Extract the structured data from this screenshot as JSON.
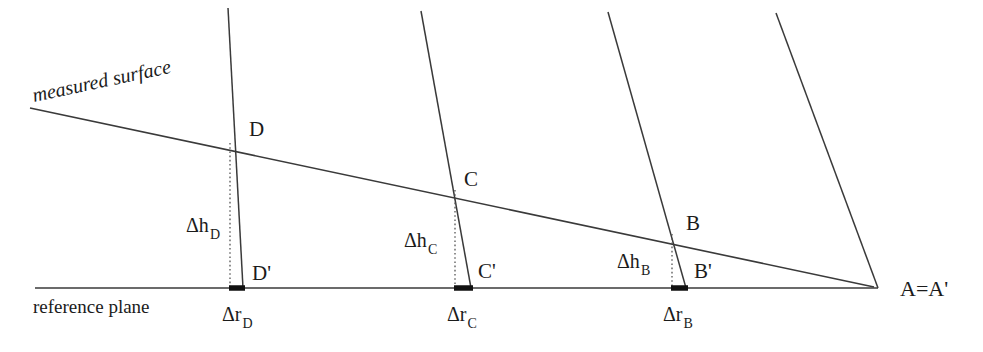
{
  "figure": {
    "width": 983,
    "height": 352,
    "background_color": "#ffffff",
    "line_color": "#3a3a3a",
    "accent_color": "#111111"
  },
  "captions": {
    "measured_surface": "measured surface",
    "reference_plane": "reference plane"
  },
  "apex": {
    "label": "A=A'",
    "x": 878,
    "y": 288,
    "label_x": 900,
    "label_y": 296
  },
  "lines": {
    "measured_surface": {
      "x1": 30,
      "y1": 108,
      "x2": 874,
      "y2": 287
    },
    "reference_plane": {
      "x1": 35,
      "y1": 288,
      "x2": 878,
      "y2": 288
    }
  },
  "radials": [
    {
      "name": "radial-d",
      "x1": 228,
      "y1": 8,
      "x2": 243,
      "y2": 288
    },
    {
      "name": "radial-c",
      "x1": 421,
      "y1": 11,
      "x2": 471,
      "y2": 288
    },
    {
      "name": "radial-b",
      "x1": 608,
      "y1": 12,
      "x2": 686,
      "y2": 288
    },
    {
      "name": "radial-a",
      "x1": 776,
      "y1": 13,
      "x2": 878,
      "y2": 288
    }
  ],
  "stations": [
    {
      "id": "d",
      "surface_point_label": "D",
      "plane_point_label": "D'",
      "height_label": "Δh",
      "height_subscript": "D",
      "radial_label": "Δr",
      "radial_subscript": "D",
      "surface_x": 240,
      "surface_y": 143,
      "plane_x": 243,
      "plane_y": 288,
      "drop_x": 230,
      "surface_label_x": 249,
      "surface_label_y": 136,
      "plane_label_x": 252,
      "plane_label_y": 280,
      "height_label_x": 186,
      "height_label_y": 232,
      "radial_label_x": 222,
      "radial_label_y": 321,
      "bar_x1": 229,
      "bar_x2": 245
    },
    {
      "id": "c",
      "surface_point_label": "C",
      "plane_point_label": "C'",
      "height_label": "Δh",
      "height_subscript": "C",
      "radial_label": "Δr",
      "radial_subscript": "C",
      "surface_x": 460,
      "surface_y": 190,
      "plane_x": 471,
      "plane_y": 288,
      "drop_x": 455,
      "surface_label_x": 464,
      "surface_label_y": 186,
      "plane_label_x": 478,
      "plane_label_y": 278,
      "height_label_x": 404,
      "height_label_y": 247,
      "radial_label_x": 447,
      "radial_label_y": 321,
      "bar_x1": 454,
      "bar_x2": 473
    },
    {
      "id": "b",
      "surface_point_label": "B",
      "plane_point_label": "B'",
      "height_label": "Δh",
      "height_subscript": "B",
      "radial_label": "Δr",
      "radial_subscript": "B",
      "surface_x": 674,
      "surface_y": 234,
      "plane_x": 686,
      "plane_y": 288,
      "drop_x": 672,
      "surface_label_x": 686,
      "surface_label_y": 230,
      "plane_label_x": 694,
      "plane_label_y": 278,
      "height_label_x": 617,
      "height_label_y": 268,
      "radial_label_x": 663,
      "radial_label_y": 321,
      "bar_x1": 671,
      "bar_x2": 688
    }
  ]
}
